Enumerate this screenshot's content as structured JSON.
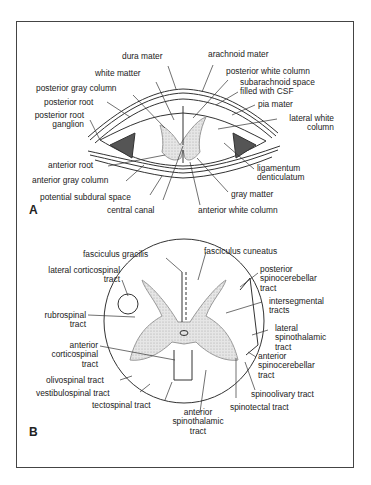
{
  "figure": {
    "panel_a": {
      "letter": "A",
      "labels": {
        "dura_mater": "dura mater",
        "arachnoid_mater": "arachnoid mater",
        "white_matter": "white matter",
        "posterior_white_column": "posterior white column",
        "posterior_gray_column": "posterior gray column",
        "subarachnoid_space_1": "subarachnoid space",
        "subarachnoid_space_2": "filled with CSF",
        "posterior_root": "posterior root",
        "pia_mater": "pia mater",
        "posterior_root_ganglion_1": "posterior root",
        "posterior_root_ganglion_2": "ganglion",
        "lateral_white_column_1": "lateral white",
        "lateral_white_column_2": "column",
        "anterior_root": "anterior root",
        "ligamentum_1": "ligamentum",
        "ligamentum_2": "denticulatum",
        "anterior_gray_column": "anterior gray column",
        "gray_matter": "gray matter",
        "potential_subdural_space": "potential subdural space",
        "central_canal": "central canal",
        "anterior_white_column": "anterior white column"
      }
    },
    "panel_b": {
      "letter": "B",
      "labels": {
        "fasciculus_gracilis": "fasciculus gracilis",
        "fasciculus_cuneatus": "fasciculus cuneatus",
        "lateral_corticospinal_1": "lateral corticospinal",
        "lateral_corticospinal_2": "tract",
        "posterior_spinocerebellar_1": "posterior",
        "posterior_spinocerebellar_2": "spinocerebellar",
        "posterior_spinocerebellar_3": "tract",
        "intersegmental_1": "intersegmental",
        "intersegmental_2": "tracts",
        "rubrospinal_1": "rubrospinal",
        "rubrospinal_2": "tract",
        "lateral_spinothalamic_1": "lateral",
        "lateral_spinothalamic_2": "spinothalamic",
        "lateral_spinothalamic_3": "tract",
        "anterior_corticospinal_1": "anterior",
        "anterior_corticospinal_2": "corticospinal",
        "anterior_corticospinal_3": "tract",
        "anterior_spinocerebellar_1": "anterior",
        "anterior_spinocerebellar_2": "spinocerebellar",
        "anterior_spinocerebellar_3": "tract",
        "olivospinal": "olivospinal tract",
        "vestibulospinal": "vestibulospinal tract",
        "spinoolivary": "spinoolivary tract",
        "tectospinal": "tectospinal tract",
        "spinotectal": "spinotectal tract",
        "anterior_spinothalamic_1": "anterior",
        "anterior_spinothalamic_2": "spinothalamic",
        "anterior_spinothalamic_3": "tract"
      }
    }
  }
}
